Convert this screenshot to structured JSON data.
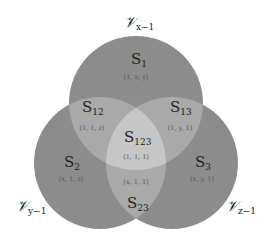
{
  "diagram": {
    "type": "venn-3",
    "colors": {
      "background": "#ffffff",
      "circle_fill": "#8c8c8c",
      "pair_overlap": "#a9a9a9",
      "triple_overlap": "#c6c6c6",
      "text": "#222222",
      "tuple_text": "#555555"
    },
    "circles": [
      {
        "id": "x",
        "label_main": "𝒱",
        "label_sub": "x−1",
        "position": "top"
      },
      {
        "id": "y",
        "label_main": "𝒱",
        "label_sub": "y−1",
        "position": "bottom-left"
      },
      {
        "id": "z",
        "label_main": "𝒱",
        "label_sub": "z−1",
        "position": "bottom-right"
      }
    ],
    "regions": {
      "s1": {
        "set": "S",
        "sub": "1",
        "tuple": "(1, x, y)"
      },
      "s2": {
        "set": "S",
        "sub": "2",
        "tuple": "(x, 1, z)"
      },
      "s3": {
        "set": "S",
        "sub": "3",
        "tuple": "(x, y, 1)"
      },
      "s12": {
        "set": "S",
        "sub": "12",
        "tuple": "(1, 1, z)"
      },
      "s13": {
        "set": "S",
        "sub": "13",
        "tuple": "(1, y, 1)"
      },
      "s23": {
        "set": "S",
        "sub": "23",
        "tuple": "(x, 1, 1)"
      },
      "s123": {
        "set": "S",
        "sub": "123",
        "tuple": "(1, 1, 1)"
      }
    }
  }
}
